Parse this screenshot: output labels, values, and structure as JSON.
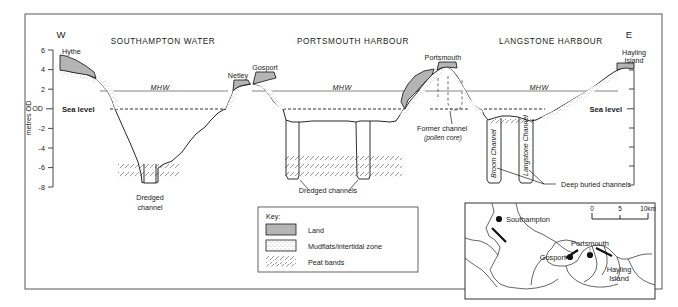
{
  "figure": {
    "type": "geological-cross-section",
    "compass": {
      "west": "W",
      "east": "E"
    },
    "axis": {
      "label": "metres OD",
      "ticks": [
        "6",
        "4",
        "2",
        "OD",
        "-2",
        "-4",
        "-6",
        "-8"
      ],
      "tick_values": [
        6,
        4,
        2,
        0,
        -2,
        -4,
        -6,
        -8
      ],
      "range": [
        -8,
        6
      ]
    },
    "section_titles": [
      "SOUTHAMPTON WATER",
      "PORTSMOUTH HARBOUR",
      "LANGSTONE HARBOUR"
    ],
    "places": [
      "Hythe",
      "Netley",
      "Gosport",
      "Portsmouth",
      "Hayling Island"
    ],
    "waterlines": {
      "mhw_label": "MHW",
      "mhw_count": 3,
      "sea_level_label": "Sea level",
      "sea_level_left": "Sea level",
      "sea_level_right": "Sea level"
    },
    "annotations": [
      {
        "name": "dredged-channel-southampton",
        "line1": "Dredged",
        "line2": "channel"
      },
      {
        "name": "dredged-channels-portsmouth",
        "line1": "Dredged channels"
      },
      {
        "name": "former-channel",
        "line1": "Former channel",
        "line2": "(pollen core)"
      },
      {
        "name": "deep-buried-channels",
        "line1": "Deep buried channels"
      }
    ],
    "named_channels": [
      "Broom Channel",
      "Langstone Channel"
    ],
    "key": {
      "title": "Key:",
      "items": [
        {
          "swatch": "land",
          "label": "Land"
        },
        {
          "swatch": "mudflats",
          "label": "Mudflats/intertidal zone"
        },
        {
          "swatch": "peat",
          "label": "Peat bands"
        }
      ]
    },
    "inset_map": {
      "places": [
        "Southampton",
        "Portsmouth",
        "Gosport",
        "Hayling Island"
      ],
      "scale": {
        "ticks": [
          "0",
          "5",
          "10km"
        ]
      }
    },
    "colors": {
      "land_fill": "#b4b4b4",
      "stroke": "#1a1a1a",
      "mhw_line": "#555555",
      "frame": "#555555"
    }
  }
}
